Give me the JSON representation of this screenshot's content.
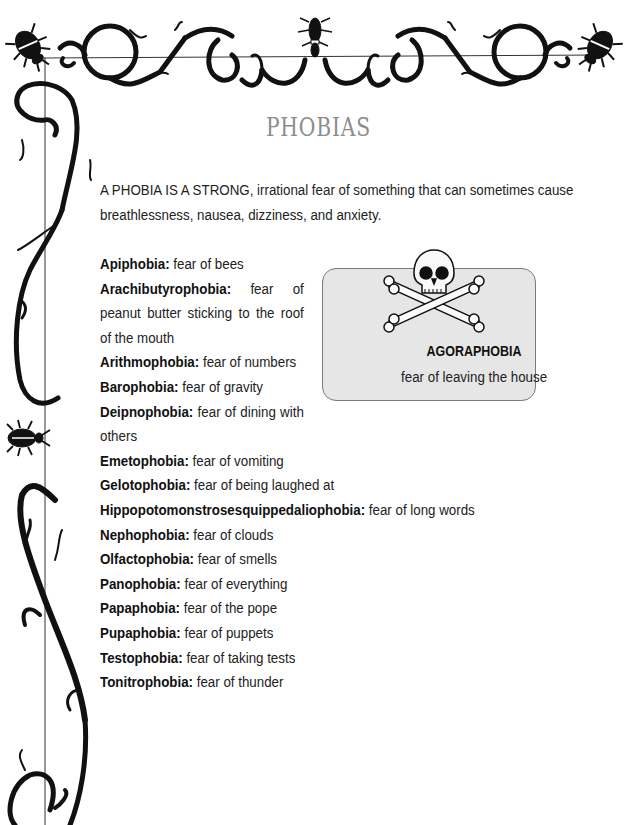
{
  "page": {
    "title": "PHOBIAS",
    "intro": "A PHOBIA IS A STRONG, irrational fear of something that can sometimes cause breathlessness, nausea, dizziness, and anxiety."
  },
  "phobias": [
    {
      "term": "Apiphobia:",
      "definition": " fear of bees"
    },
    {
      "term": "Arachibutyrophobia:",
      "definition": " fear of peanut butter sticking to the roof of the mouth"
    },
    {
      "term": "Arithmophobia:",
      "definition": " fear of numbers"
    },
    {
      "term": "Barophobia:",
      "definition": " fear of gravity"
    },
    {
      "term": "Deipnophobia:",
      "definition": " fear of dining with others"
    },
    {
      "term": "Emetophobia:",
      "definition": " fear of vomiting"
    },
    {
      "term": "Gelotophobia:",
      "definition": " fear of being laughed at"
    },
    {
      "term": "Hippopotomonstrosesquippedaliophobia:",
      "definition": " fear of long words"
    },
    {
      "term": "Nephophobia:",
      "definition": " fear of clouds"
    },
    {
      "term": "Olfactophobia:",
      "definition": " fear of smells"
    },
    {
      "term": "Panophobia:",
      "definition": " fear of everything"
    },
    {
      "term": "Papaphobia:",
      "definition": " fear of the pope"
    },
    {
      "term": "Pupaphobia:",
      "definition": " fear of puppets"
    },
    {
      "term": "Testophobia:",
      "definition": " fear of taking tests"
    },
    {
      "term": "Tonitrophobia:",
      "definition": " fear of thunder"
    }
  ],
  "callout": {
    "icon": "skull-and-crossbones-icon",
    "term": "AGORAPHOBIA",
    "definition": "fear of leaving the house"
  },
  "colors": {
    "title": "#8c8c8c",
    "callout_bg": "#e6e6e6",
    "callout_border": "#7a7a7a",
    "ornament": "#111111"
  }
}
